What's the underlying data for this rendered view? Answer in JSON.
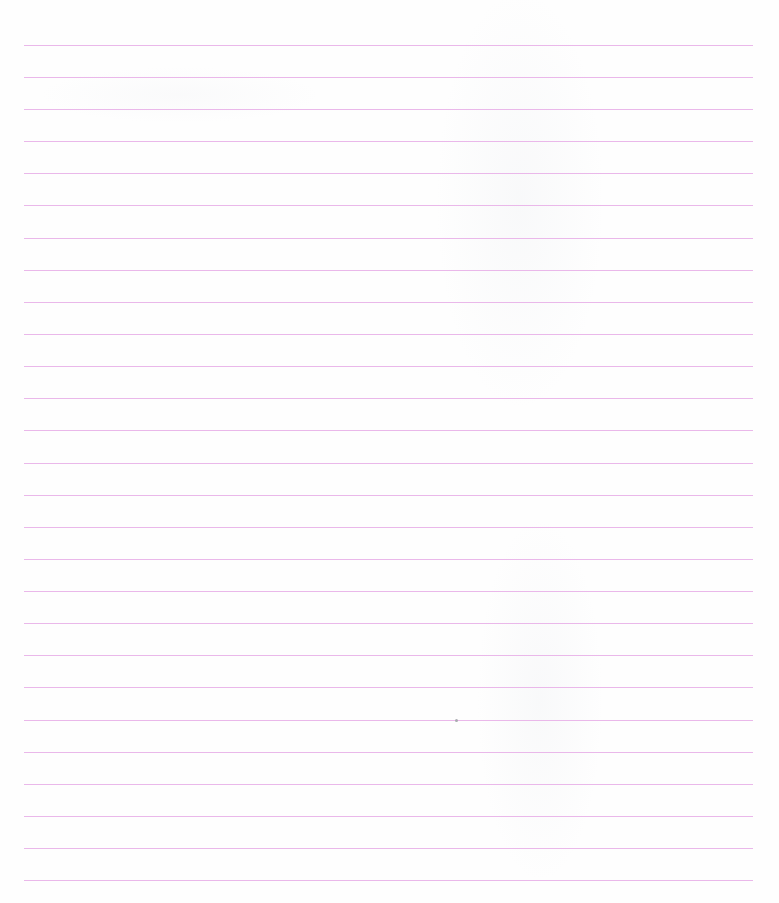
{
  "document": {
    "type": "lined-paper-scan",
    "rule_color": "#eab8ea",
    "rule_count": 27,
    "rule_left": 24,
    "rule_right": 753,
    "rule_spacing_px": 32.1,
    "first_rule_y": 45,
    "text": "",
    "rules": [
      45,
      77,
      109,
      141,
      173,
      205,
      238,
      270,
      302,
      334,
      366,
      398,
      430,
      463,
      495,
      527,
      559,
      591,
      623,
      655,
      687,
      720,
      752,
      784,
      816,
      848,
      880
    ],
    "specks": [
      {
        "x": 455,
        "y": 719
      }
    ]
  }
}
